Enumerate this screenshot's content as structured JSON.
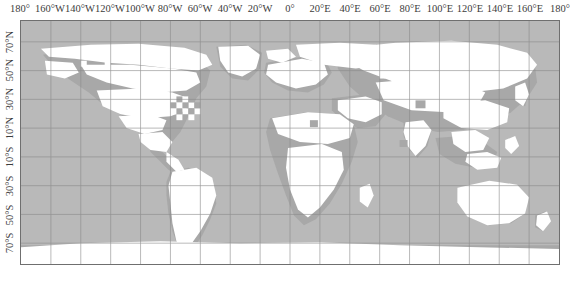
{
  "figure": {
    "type": "world-map",
    "projection": "equirectangular",
    "caption": "",
    "colors": {
      "ocean": "#b9b9b9",
      "land": "#ffffff",
      "land_shade": "#a8a8a8",
      "gridline": "#8a8a8a",
      "frame": "#6f6f6f",
      "background": "#ffffff",
      "label": "#3c3c3c"
    }
  },
  "axes": {
    "longitude": {
      "position": "top",
      "labels": [
        "180°",
        "160°W",
        "140°W",
        "120°W",
        "100°W",
        "80°W",
        "60°W",
        "40°W",
        "20°W",
        "0°",
        "20°E",
        "40°E",
        "60°E",
        "80°E",
        "100°E",
        "120°E",
        "140°E",
        "160°E",
        "180°"
      ],
      "values": [
        -180,
        -160,
        -140,
        -120,
        -100,
        -80,
        -60,
        -40,
        -20,
        0,
        20,
        40,
        60,
        80,
        100,
        120,
        140,
        160,
        180
      ],
      "range": [
        -180,
        180
      ]
    },
    "latitude": {
      "position": "left",
      "rotated": true,
      "labels": [
        "70°N",
        "50°N",
        "30°N",
        "10°N",
        "10°S",
        "30°S",
        "50°S",
        "70°S"
      ],
      "values": [
        70,
        50,
        30,
        10,
        -10,
        -30,
        -50,
        -70
      ],
      "range": [
        -85,
        85
      ]
    }
  },
  "chart_data": {
    "type": "heatmap",
    "title": "",
    "subtitle": "",
    "xlabel": "",
    "ylabel": "",
    "xlim": [
      -180,
      180
    ],
    "ylim": [
      -85,
      85
    ],
    "grid": true,
    "legend": null,
    "series": [
      {
        "name": "data-coverage-cells",
        "color": "#ffffff",
        "description": "white filled land / data cells"
      },
      {
        "name": "no-data-background",
        "color": "#b9b9b9",
        "description": "gray ocean / no-data background"
      },
      {
        "name": "shaded-land",
        "color": "#a8a8a8",
        "description": "mid-gray land without data"
      }
    ],
    "gridlines": {
      "x": [
        -180,
        -160,
        -140,
        -120,
        -100,
        -80,
        -60,
        -40,
        -20,
        0,
        20,
        40,
        60,
        80,
        100,
        120,
        140,
        160,
        180
      ],
      "y": [
        70,
        50,
        30,
        10,
        -10,
        -30,
        -50,
        -70
      ]
    }
  }
}
